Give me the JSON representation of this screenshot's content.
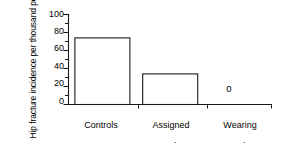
{
  "chart_data": {
    "type": "bar",
    "title": "",
    "subtitle": "",
    "xlabel": "",
    "ylabel": "Hip fracture incidence per thousand per year",
    "ylabel_lines": [
      "Hip fracture incidence",
      "per thousand per year"
    ],
    "categories": [
      "Controls",
      "Assigned pads",
      "Wearing pads"
    ],
    "category_lines": [
      [
        "Controls"
      ],
      [
        "Assigned",
        "pads"
      ],
      [
        "Wearing",
        "pads"
      ]
    ],
    "values": [
      74,
      34,
      0
    ],
    "value_labels": [
      "",
      "",
      "0"
    ],
    "ylim": [
      0,
      100
    ],
    "ytick_values": [
      0,
      20,
      40,
      60,
      80,
      100
    ],
    "ytick_labels": [
      "0",
      "20",
      "40",
      "60",
      "80",
      "100"
    ],
    "yminor_step": 10,
    "grid": false,
    "legend": false,
    "legend_position": "none",
    "bar_fill_color": "#ffffff",
    "bar_edge_color": "#1a1a1a",
    "axis_color": "#1a1a1a",
    "text_color": "#000000"
  }
}
